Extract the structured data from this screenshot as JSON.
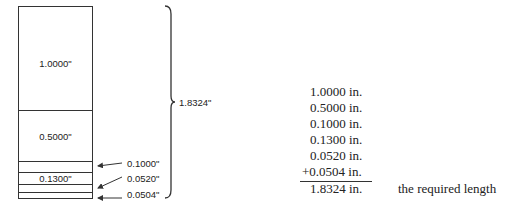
{
  "diagram": {
    "blocks": [
      {
        "label": "1.0000\"",
        "top": 0,
        "height": 104
      },
      {
        "label": "0.5000\"",
        "top": 104,
        "height": 51
      },
      {
        "label": "",
        "top": 155,
        "height": 11
      },
      {
        "label": "0.1300\"",
        "top": 166,
        "height": 12
      },
      {
        "label": "",
        "top": 178,
        "height": 8
      },
      {
        "label": "",
        "top": 186,
        "height": 7
      }
    ],
    "callouts": [
      {
        "label": "0.1000\""
      },
      {
        "label": "0.0520\""
      },
      {
        "label": "0.0504\""
      }
    ],
    "total_label": "1.8324\""
  },
  "calculation": {
    "rows": [
      "1.0000 in.",
      "0.5000 in.",
      "0.1000 in.",
      "0.1300 in.",
      "0.0520 in.",
      "+0.0504 in."
    ],
    "total": "1.8324 in.",
    "note": "the required length"
  }
}
